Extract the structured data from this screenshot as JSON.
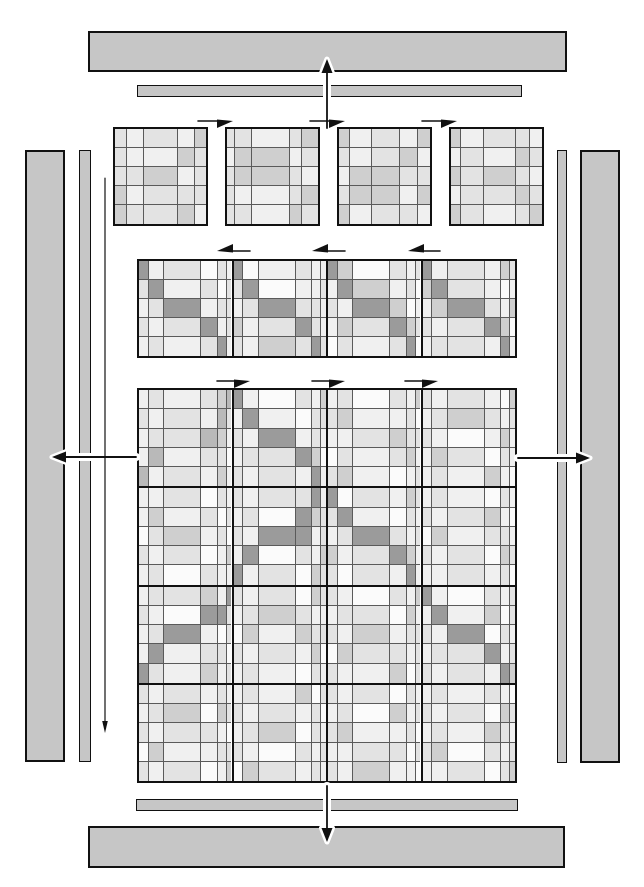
{
  "figure": {
    "title": "",
    "background": "#ffffff",
    "ink": "#111111",
    "bar_fill": "#c6c6c6",
    "bar_border": "#111111",
    "cell_line": "#5a5a5a",
    "palette": [
      "#fbfbfb",
      "#f0f0f0",
      "#e3e3e3",
      "#cfcfcf",
      "#b9b9b9",
      "#9b9b9b"
    ],
    "bars": [
      {
        "name": "top-outer-bar",
        "x": 88,
        "y": 31,
        "w": 479,
        "h": 41,
        "thick": true
      },
      {
        "name": "top-inner-bar",
        "x": 137,
        "y": 85,
        "w": 385,
        "h": 12,
        "thick": false
      },
      {
        "name": "left-outer-bar",
        "x": 25,
        "y": 150,
        "w": 40,
        "h": 612,
        "thick": true
      },
      {
        "name": "left-inner-bar",
        "x": 79,
        "y": 150,
        "w": 12,
        "h": 612,
        "thick": false
      },
      {
        "name": "right-inner-bar",
        "x": 557,
        "y": 150,
        "w": 10,
        "h": 613,
        "thick": false
      },
      {
        "name": "right-outer-bar",
        "x": 580,
        "y": 150,
        "w": 40,
        "h": 613,
        "thick": true
      },
      {
        "name": "bottom-inner-bar",
        "x": 136,
        "y": 799,
        "w": 382,
        "h": 12,
        "thick": false
      },
      {
        "name": "bottom-outer-bar",
        "x": 88,
        "y": 826,
        "w": 477,
        "h": 42,
        "thick": true
      }
    ],
    "small_matrices": {
      "row_weights": [
        20,
        20,
        20,
        20,
        20
      ],
      "items": [
        {
          "name": "small-matrix-1",
          "x": 113,
          "y": 127,
          "w": 95,
          "h": 99,
          "col_weights": [
            13,
            17,
            36,
            17,
            12
          ],
          "cells": [
            "21213",
            "21132",
            "22312",
            "31222",
            "32231"
          ]
        },
        {
          "name": "small-matrix-2",
          "x": 225,
          "y": 127,
          "w": 95,
          "h": 99,
          "col_weights": [
            8,
            18,
            40,
            12,
            17
          ],
          "cells": [
            "22123",
            "13312",
            "23321",
            "21123",
            "22132"
          ]
        },
        {
          "name": "small-matrix-3",
          "x": 337,
          "y": 127,
          "w": 95,
          "h": 99,
          "col_weights": [
            12,
            22,
            30,
            18,
            13
          ],
          "cells": [
            "31213",
            "21231",
            "13322",
            "23313",
            "31221"
          ]
        },
        {
          "name": "small-matrix-4",
          "x": 449,
          "y": 127,
          "w": 95,
          "h": 99,
          "col_weights": [
            10,
            24,
            34,
            14,
            13
          ],
          "cells": [
            "31221",
            "12132",
            "32321",
            "12232",
            "32123"
          ]
        }
      ]
    },
    "strip_matrix": {
      "name": "panel-strip-matrix",
      "x": 137,
      "y": 259,
      "w": 380,
      "h": 99,
      "block_rows": 1,
      "block_cols": 4,
      "col_weights": [
        10,
        16,
        38,
        17,
        9,
        5
      ],
      "row_weights": [
        20,
        20,
        20,
        20,
        20
      ],
      "blocks": [
        [
          [
            "512021",
            "251202",
            "125122",
            "212512",
            "121251"
          ],
          [
            "501211",
            "250112",
            "125221",
            "312521",
            "213252"
          ],
          [
            "530212",
            "153120",
            "215301",
            "132532",
            "021250"
          ],
          [
            "512132",
            "352101",
            "135213",
            "212530",
            "122151"
          ]
        ]
      ]
    },
    "large_matrix": {
      "name": "main-matrix",
      "x": 137,
      "y": 388,
      "w": 380,
      "h": 395,
      "block_rows": 4,
      "block_cols": 4,
      "col_weights": [
        10,
        16,
        38,
        17,
        9,
        5
      ],
      "row_weights": [
        20,
        20,
        20,
        20,
        20
      ],
      "blocks": [
        [
          [
            "121234",
            "212142",
            "122431",
            "141220",
            "412131"
          ],
          [
            "510213",
            "151022",
            "215121",
            "122530",
            "212151"
          ],
          [
            "120213",
            "231120",
            "112322",
            "021231",
            "231012"
          ],
          [
            "212103",
            "123212",
            "210131",
            "132021",
            "121310"
          ]
        ],
        [
          [
            "112021",
            "131202",
            "023120",
            "212013",
            "120211"
          ],
          [
            "212251",
            "120532",
            "215512",
            "150213",
            "512032"
          ],
          [
            "502132",
            "251021",
            "125212",
            "312531",
            "202151"
          ],
          [
            "121021",
            "212310",
            "031221",
            "212032",
            "112120"
          ]
        ],
        [
          [
            "122315",
            "210552",
            "125102",
            "151220",
            "521312"
          ],
          [
            "212032",
            "123211",
            "031322",
            "212130",
            "121021"
          ],
          [
            "210213",
            "122031",
            "213122",
            "032212",
            "211302"
          ],
          [
            "510212",
            "151302",
            "215021",
            "122512",
            "212153"
          ]
        ],
        [
          [
            "212121",
            "123032",
            "212210",
            "031122",
            "212013"
          ],
          [
            "121302",
            "212120",
            "123021",
            "210212",
            "032121"
          ],
          [
            "212021",
            "120312",
            "231120",
            "112202",
            "213110"
          ],
          [
            "121210",
            "212032",
            "121321",
            "230212",
            "112023"
          ]
        ]
      ]
    },
    "arrows": [
      {
        "name": "up-transfer-arrow",
        "kind": "cased",
        "x1": 327,
        "y1": 128,
        "x2": 327,
        "y2": 59
      },
      {
        "name": "down-transfer-arrow",
        "kind": "cased",
        "x1": 327,
        "y1": 786,
        "x2": 327,
        "y2": 842
      },
      {
        "name": "left-transfer-arrow",
        "kind": "cased",
        "x1": 136,
        "y1": 457,
        "x2": 52,
        "y2": 457
      },
      {
        "name": "right-transfer-arrow",
        "kind": "cased",
        "x1": 518,
        "y1": 458,
        "x2": 590,
        "y2": 458
      },
      {
        "name": "left-sweep-arrow",
        "kind": "thin",
        "x1": 105,
        "y1": 178,
        "x2": 105,
        "y2": 733
      },
      {
        "name": "flow-arrow-top-1",
        "kind": "flow",
        "x1": 198,
        "y1": 121,
        "x2": 233,
        "y2": 121
      },
      {
        "name": "flow-arrow-top-2",
        "kind": "flow",
        "x1": 310,
        "y1": 121,
        "x2": 345,
        "y2": 121
      },
      {
        "name": "flow-arrow-top-3",
        "kind": "flow",
        "x1": 422,
        "y1": 121,
        "x2": 457,
        "y2": 121
      },
      {
        "name": "flow-arrow-strip-1",
        "kind": "flow",
        "x1": 250,
        "y1": 251,
        "x2": 217,
        "y2": 251
      },
      {
        "name": "flow-arrow-strip-2",
        "kind": "flow",
        "x1": 345,
        "y1": 251,
        "x2": 312,
        "y2": 251
      },
      {
        "name": "flow-arrow-strip-3",
        "kind": "flow",
        "x1": 440,
        "y1": 251,
        "x2": 408,
        "y2": 251
      },
      {
        "name": "flow-arrow-main-1",
        "kind": "flow",
        "x1": 217,
        "y1": 381,
        "x2": 250,
        "y2": 381
      },
      {
        "name": "flow-arrow-main-2",
        "kind": "flow",
        "x1": 312,
        "y1": 381,
        "x2": 345,
        "y2": 381
      },
      {
        "name": "flow-arrow-main-3",
        "kind": "flow",
        "x1": 405,
        "y1": 381,
        "x2": 438,
        "y2": 381
      }
    ]
  }
}
